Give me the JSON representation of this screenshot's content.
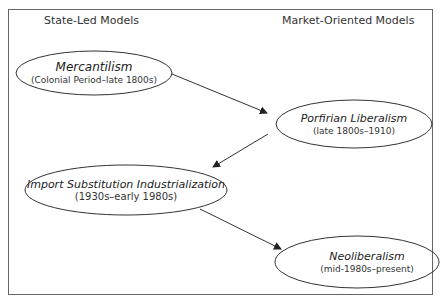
{
  "headers": {
    "left": "State-Led Models",
    "right": "Market-Oriented Models"
  },
  "nodes": [
    {
      "id": "mercantilism",
      "title": "Mercantilism",
      "period": "(Colonial Period–late 1800s)",
      "column": "State-Led Models"
    },
    {
      "id": "porfirian",
      "title": "Porfirian Liberalism",
      "period": "(late 1800s–1910)",
      "column": "Market-Oriented Models"
    },
    {
      "id": "isi",
      "title": "Import Substitution Industrialization",
      "period": "(1930s–early 1980s)",
      "column": "State-Led Models"
    },
    {
      "id": "neoliberalism",
      "title": "Neoliberalism",
      "period": "(mid-1980s–present)",
      "column": "Market-Oriented Models"
    }
  ],
  "edges": [
    {
      "from": "mercantilism",
      "to": "porfirian"
    },
    {
      "from": "porfirian",
      "to": "isi"
    },
    {
      "from": "isi",
      "to": "neoliberalism"
    }
  ],
  "colors": {
    "stroke": "#333333",
    "frame": "#666666",
    "background": "#ffffff"
  }
}
